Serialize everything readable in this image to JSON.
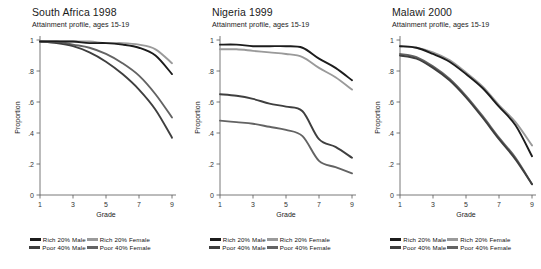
{
  "figure": {
    "axis_label_x": "Grade",
    "axis_label_y": "Proportion",
    "y_ticks": [
      "0",
      ".2",
      ".4",
      ".6",
      ".8",
      "1"
    ],
    "y_tick_values": [
      0,
      0.2,
      0.4,
      0.6,
      0.8,
      1
    ],
    "x_ticks": [
      "1",
      "3",
      "5",
      "7",
      "9"
    ],
    "x_tick_values": [
      1,
      3,
      5,
      7,
      9
    ],
    "subtitle": "Attainment profile, ages 15-19",
    "series_colors": {
      "rich_male": "#1c1c1c",
      "rich_female": "#9a9a9a",
      "poor_male": "#3f3f3f",
      "poor_female": "#636363"
    },
    "legend": [
      {
        "label": "Rich 20% Male",
        "color": "#1c1c1c",
        "key": "rich_male"
      },
      {
        "label": "Rich 20% Female",
        "color": "#9a9a9a",
        "key": "rich_female"
      },
      {
        "label": "Poor 40% Male",
        "color": "#3f3f3f",
        "key": "poor_male"
      },
      {
        "label": "Poor 40% Female",
        "color": "#636363",
        "key": "poor_female"
      }
    ]
  },
  "chart_data": [
    {
      "type": "line",
      "title": "South Africa 1998",
      "subtitle": "Attainment profile, ages 15-19",
      "xlabel": "Grade",
      "ylabel": "Proportion",
      "xlim": [
        1,
        9
      ],
      "ylim": [
        0,
        1
      ],
      "grid": false,
      "legend_position": "bottom",
      "x": [
        1,
        2,
        3,
        4,
        5,
        6,
        7,
        8,
        9
      ],
      "series": [
        {
          "name": "Rich 20% Male",
          "values": [
            0.99,
            0.99,
            0.99,
            0.98,
            0.98,
            0.97,
            0.95,
            0.9,
            0.78
          ]
        },
        {
          "name": "Rich 20% Female",
          "values": [
            0.99,
            0.99,
            0.99,
            0.99,
            0.98,
            0.98,
            0.97,
            0.94,
            0.85
          ]
        },
        {
          "name": "Poor 40% Male",
          "values": [
            0.99,
            0.98,
            0.96,
            0.92,
            0.86,
            0.78,
            0.68,
            0.55,
            0.37
          ]
        },
        {
          "name": "Poor 40% Female",
          "values": [
            0.99,
            0.99,
            0.97,
            0.95,
            0.91,
            0.85,
            0.77,
            0.65,
            0.5
          ]
        }
      ]
    },
    {
      "type": "line",
      "title": "Nigeria 1999",
      "subtitle": "Attainment profile, ages 15-19",
      "xlabel": "Grade",
      "ylabel": "Proportion",
      "xlim": [
        1,
        9
      ],
      "ylim": [
        0,
        1
      ],
      "grid": false,
      "legend_position": "bottom",
      "x": [
        1,
        2,
        3,
        4,
        5,
        6,
        7,
        8,
        9
      ],
      "series": [
        {
          "name": "Rich 20% Male",
          "values": [
            0.97,
            0.97,
            0.96,
            0.96,
            0.96,
            0.95,
            0.88,
            0.82,
            0.74
          ]
        },
        {
          "name": "Rich 20% Female",
          "values": [
            0.94,
            0.94,
            0.93,
            0.92,
            0.91,
            0.89,
            0.82,
            0.76,
            0.68
          ]
        },
        {
          "name": "Poor 40% Male",
          "values": [
            0.65,
            0.64,
            0.62,
            0.59,
            0.57,
            0.54,
            0.36,
            0.31,
            0.24
          ]
        },
        {
          "name": "Poor 40% Female",
          "values": [
            0.48,
            0.47,
            0.46,
            0.44,
            0.42,
            0.38,
            0.22,
            0.18,
            0.14
          ]
        }
      ]
    },
    {
      "type": "line",
      "title": "Malawi 2000",
      "subtitle": "Attainment profile, ages 15-19",
      "xlabel": "Grade",
      "ylabel": "Proportion",
      "xlim": [
        1,
        9
      ],
      "ylim": [
        0,
        1
      ],
      "grid": false,
      "legend_position": "bottom",
      "x": [
        1,
        2,
        3,
        4,
        5,
        6,
        7,
        8,
        9
      ],
      "series": [
        {
          "name": "Rich 20% Male",
          "values": [
            0.96,
            0.95,
            0.91,
            0.86,
            0.78,
            0.69,
            0.57,
            0.45,
            0.25
          ]
        },
        {
          "name": "Rich 20% Female",
          "values": [
            0.96,
            0.95,
            0.92,
            0.87,
            0.79,
            0.7,
            0.58,
            0.47,
            0.32
          ]
        },
        {
          "name": "Poor 40% Male",
          "values": [
            0.9,
            0.88,
            0.82,
            0.74,
            0.63,
            0.5,
            0.36,
            0.23,
            0.07
          ]
        },
        {
          "name": "Poor 40% Female",
          "values": [
            0.91,
            0.89,
            0.83,
            0.75,
            0.64,
            0.51,
            0.37,
            0.24,
            0.07
          ]
        }
      ]
    }
  ]
}
